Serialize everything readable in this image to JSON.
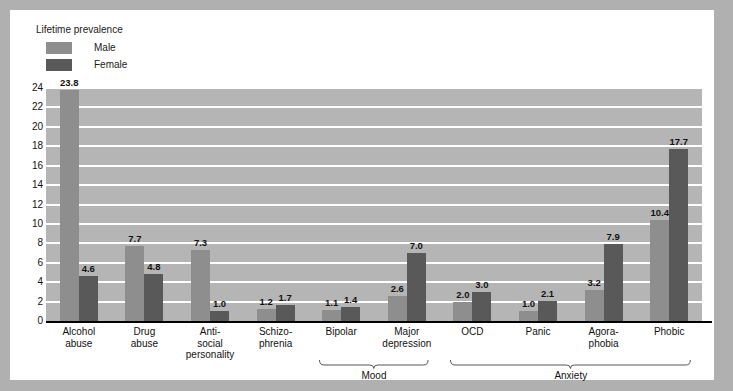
{
  "legend": {
    "title": "Lifetime prevalence",
    "entries": [
      {
        "label": "Male",
        "color": "#8e8e8e"
      },
      {
        "label": "Female",
        "color": "#595959"
      }
    ]
  },
  "axis": {
    "yticks": [
      "24",
      "22",
      "20",
      "18",
      "16",
      "14",
      "12",
      "10",
      "8",
      "6",
      "4",
      "2",
      "0"
    ]
  },
  "brackets": [
    {
      "label": "Mood"
    },
    {
      "label": "Anxiety"
    }
  ],
  "chart_data": {
    "type": "bar",
    "title": "Lifetime prevalence",
    "xlabel": "",
    "ylabel": "",
    "ylim": [
      0,
      24
    ],
    "ytick_step": 2,
    "grid": true,
    "legend_position": "top-left",
    "categories": [
      "Alcohol abuse",
      "Drug abuse",
      "Anti-social personality",
      "Schizo-phrenia",
      "Bipolar",
      "Major depression",
      "OCD",
      "Panic",
      "Agoraphobia",
      "Phobic"
    ],
    "category_lines": [
      [
        "Alcohol",
        "abuse"
      ],
      [
        "Drug",
        "abuse"
      ],
      [
        "Anti-",
        "social",
        "personality"
      ],
      [
        "Schizo-",
        "phrenia"
      ],
      [
        "Bipolar"
      ],
      [
        "Major",
        "depression"
      ],
      [
        "OCD"
      ],
      [
        "Panic"
      ],
      [
        "Agora-",
        "phobia"
      ],
      [
        "Phobic"
      ]
    ],
    "series": [
      {
        "name": "Male",
        "color": "#8e8e8e",
        "values": [
          23.8,
          7.7,
          7.3,
          1.2,
          1.1,
          2.6,
          2.0,
          1.0,
          3.2,
          10.4
        ]
      },
      {
        "name": "Female",
        "color": "#595959",
        "values": [
          4.6,
          4.8,
          1.0,
          1.7,
          1.4,
          7.0,
          3.0,
          2.1,
          7.9,
          17.7
        ]
      }
    ],
    "groupings": [
      {
        "label": "Mood",
        "categories": [
          "Bipolar",
          "Major depression"
        ]
      },
      {
        "label": "Anxiety",
        "categories": [
          "OCD",
          "Panic",
          "Agoraphobia",
          "Phobic"
        ]
      }
    ]
  }
}
